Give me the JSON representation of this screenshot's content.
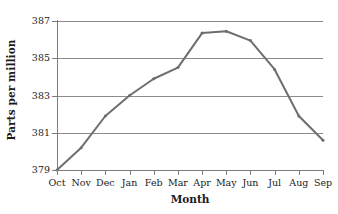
{
  "chart_data": {
    "type": "line",
    "title": "",
    "xlabel": "Month",
    "ylabel": "Parts per million",
    "categories": [
      "Oct",
      "Nov",
      "Dec",
      "Jan",
      "Feb",
      "Mar",
      "Apr",
      "May",
      "Jun",
      "Jul",
      "Aug",
      "Sep"
    ],
    "values": [
      379.0,
      380.2,
      381.9,
      383.0,
      383.9,
      384.5,
      386.35,
      386.45,
      385.95,
      384.4,
      381.9,
      380.6
    ],
    "series": [
      {
        "name": "Parts per million",
        "values": [
          379.0,
          380.2,
          381.9,
          383.0,
          383.9,
          384.5,
          386.35,
          386.45,
          385.95,
          384.4,
          381.9,
          380.6
        ]
      }
    ],
    "ylim": [
      379,
      387
    ],
    "y_ticks": [
      379,
      381,
      383,
      385,
      387
    ],
    "y_tick_labels": [
      "379",
      "381",
      "383",
      "385",
      "387"
    ],
    "x_tick_labels": [
      "Oct",
      "Nov",
      "Dec",
      "Jan",
      "Feb",
      "Mar",
      "Apr",
      "May",
      "Jun",
      "Jul",
      "Aug",
      "Sep"
    ],
    "grid": true,
    "grid_axis": "y",
    "legend": false,
    "legend_position": "none",
    "line_color": "#6e6e6e",
    "grid_color": "#8c8c8c",
    "axis_color": "#7d7d7d",
    "background_color": "#ffffff",
    "marker": "small-vertex",
    "annotations": []
  },
  "axes": {
    "y_title": "Parts per million",
    "x_title": "Month"
  }
}
